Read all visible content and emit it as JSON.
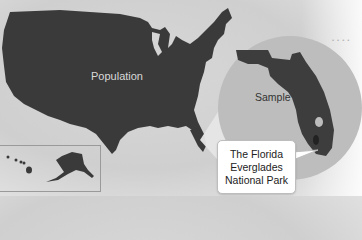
{
  "diagram": {
    "type": "population-sample map",
    "labels": {
      "population": "Population",
      "sample": "Sample",
      "callout_lines": [
        "The Florida",
        "Everglades",
        "National Park"
      ]
    },
    "regions": {
      "population_map": "Contiguous United States",
      "inset": "Alaska and Hawaii",
      "sample_circle": "Florida (enlarged)",
      "highlight": "Everglades National Park"
    },
    "colors": {
      "map_fill": "#3a3a3a",
      "sample_circle": "#bdbdbd",
      "zoom_beam": "#e6e6e6",
      "callout_bg": "#ffffff"
    }
  }
}
